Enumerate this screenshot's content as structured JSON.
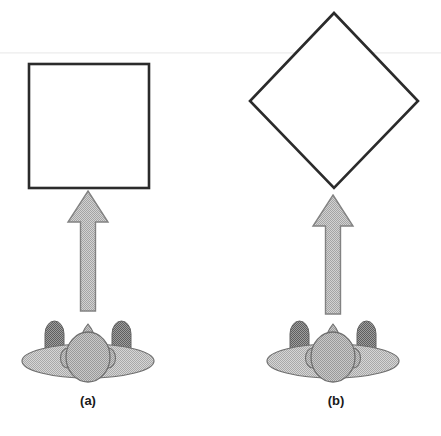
{
  "figure": {
    "background_color": "#ffffff",
    "width": 441,
    "height": 436
  },
  "panels": [
    {
      "id": "a",
      "caption": "(a)",
      "shape": {
        "name": "square",
        "orientation_degrees": 0,
        "stroke_color": "#2b2b2b",
        "fill_color": "#ffffff",
        "stroke_width": 2.4,
        "left": 29,
        "top": 64,
        "width": 120,
        "height": 124,
        "center_x": 89,
        "center_y": 126
      },
      "arrow": {
        "name": "viewing-direction-arrow",
        "direction": "up",
        "fill_color": "#b8b8b8",
        "stroke_color": "#7a7a7a",
        "tip_x": 88,
        "tip_y": 191,
        "tail_y": 311,
        "head_half_width": 20,
        "shaft_half_width": 6.5
      },
      "observer": {
        "name": "observer-figure",
        "view": "from-behind",
        "body_color": "#c2c2c2",
        "head_color": "#a8a8a8",
        "shoulder_color": "#8a8a8a",
        "outline_color": "#6f6f6f",
        "center_x": 88,
        "base_y": 362
      }
    },
    {
      "id": "b",
      "caption": "(b)",
      "shape": {
        "name": "diamond",
        "orientation_degrees": 45,
        "stroke_color": "#2b2b2b",
        "fill_color": "#ffffff",
        "stroke_width": 2.4,
        "top_vertex_x": 334,
        "top_vertex_y": 13,
        "left_vertex_x": 250,
        "left_vertex_y": 101,
        "right_vertex_x": 418,
        "right_vertex_y": 101,
        "bottom_vertex_x": 334,
        "bottom_vertex_y": 188,
        "center_x": 334,
        "center_y": 101
      },
      "arrow": {
        "name": "viewing-direction-arrow",
        "direction": "up",
        "fill_color": "#b8b8b8",
        "stroke_color": "#7a7a7a",
        "tip_x": 333,
        "tip_y": 195,
        "tail_y": 314,
        "head_half_width": 20,
        "shaft_half_width": 6.5
      },
      "observer": {
        "name": "observer-figure",
        "view": "from-behind",
        "body_color": "#c2c2c2",
        "head_color": "#a8a8a8",
        "shoulder_color": "#8a8a8a",
        "outline_color": "#6f6f6f",
        "center_x": 333,
        "base_y": 362
      }
    }
  ],
  "colors": {
    "line": "#2b2b2b",
    "arrow_fill": "#b8b8b8",
    "arrow_stroke": "#7a7a7a",
    "observer_body": "#c2c2c2",
    "observer_head": "#a8a8a8",
    "observer_shoulder": "#8a8a8a",
    "observer_outline": "#6f6f6f",
    "caption_text": "#1a1a1a",
    "page_background": "#ffffff"
  }
}
